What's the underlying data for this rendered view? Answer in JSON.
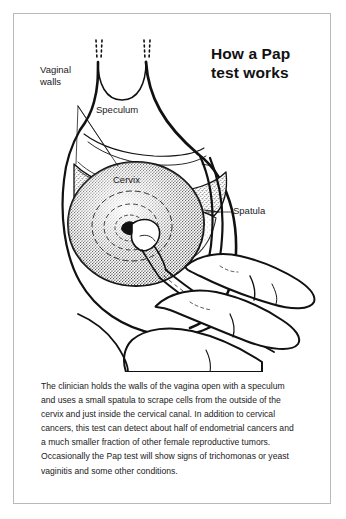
{
  "title": "How a Pap test works",
  "labels": {
    "vaginal_walls": "Vaginal walls",
    "speculum": "Speculum",
    "cervix": "Cervix",
    "spatula": "Spatula"
  },
  "caption": "The clinician holds the walls of the vagina open with a speculum and uses a small spatula to scrape cells from the outside of the cervix and just inside the cervical canal. In addition to cervical cancers, this test can detect about half of endometrial cancers and a much smaller fraction of other female reproductive tumors. Occasionally the Pap test will show signs of trichomonas or yeast vaginitis and some other conditions.",
  "colors": {
    "frame": "#b9b9b9",
    "ink": "#1a1a1a",
    "background": "#ffffff"
  },
  "illustration": {
    "name": "pap-test-anatomical-diagram",
    "parts": [
      "speculum-blades",
      "vaginal-walls",
      "cervix",
      "cervical-os",
      "spatula",
      "clinician-hand"
    ]
  }
}
